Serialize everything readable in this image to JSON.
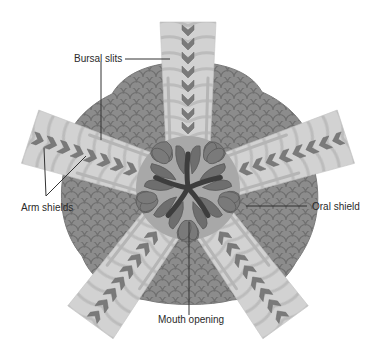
{
  "diagram": {
    "center": {
      "x": 188,
      "y": 188
    },
    "arms": [
      {
        "name": "top",
        "angle": -90
      },
      {
        "name": "upper-right",
        "angle": -18
      },
      {
        "name": "lower-right",
        "angle": 54
      },
      {
        "name": "lower-left",
        "angle": 126
      },
      {
        "name": "upper-left",
        "angle": 198
      }
    ],
    "colors": {
      "background": "#ffffff",
      "arm_fill": "#cfcfcf",
      "arm_band": "#bdbdbd",
      "disk_fill": "#8a8a8a",
      "disk_scale_line": "#6e6e6e",
      "oral_plate": "#7a7a7a",
      "oral_plate_dark": "#5f5f5f",
      "mouth_slit": "#3d3d3d",
      "chevron": "#7c7c7c",
      "bursal_slit": "#b8b8b8",
      "label_text": "#2a2a2a",
      "leader_line": "#333333"
    }
  },
  "labels": {
    "bursal_slits": "Bursal slits",
    "arm_shields": "Arm shields",
    "oral_shield": "Oral shield",
    "mouth_opening": "Mouth opening"
  }
}
